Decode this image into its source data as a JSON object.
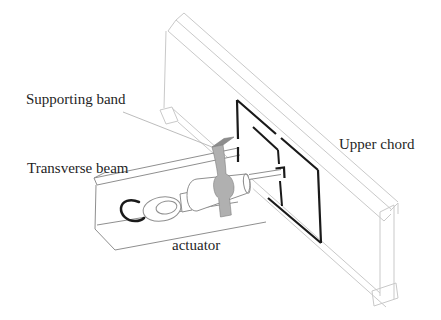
{
  "figure": {
    "labels": {
      "supporting_band": "Supporting band",
      "transverse_beam": "Transverse beam",
      "upper_chord": "Upper chord",
      "actuator": "actuator"
    },
    "colors": {
      "background": "#ffffff",
      "chord_line": "#c9c9c9",
      "beam_line": "#8f8f8f",
      "frame": "#1a1a1a",
      "band_fill": "#b0b0b0",
      "band_top_fill": "#8d8d8d",
      "leader": "#ababab",
      "text": "#1f1f1f"
    }
  }
}
